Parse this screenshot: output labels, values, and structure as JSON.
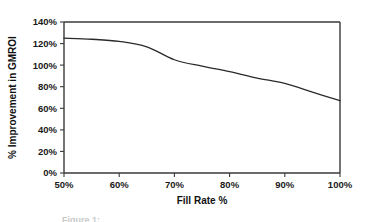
{
  "chart_data": {
    "type": "line",
    "title": "",
    "xlabel": "Fill Rate %",
    "ylabel": "% Improvement in GMROI",
    "xlim": [
      50,
      100
    ],
    "ylim": [
      0,
      140
    ],
    "grid": false,
    "legend": "none",
    "x_tick_labels": [
      "50%",
      "60%",
      "70%",
      "80%",
      "90%",
      "100%"
    ],
    "x_tick_values": [
      50,
      60,
      70,
      80,
      90,
      100
    ],
    "y_tick_labels": [
      "0%",
      "20%",
      "40%",
      "60%",
      "80%",
      "100%",
      "120%",
      "140%"
    ],
    "y_tick_values": [
      0,
      20,
      40,
      60,
      80,
      100,
      120,
      140
    ],
    "series": [
      {
        "name": "% Improvement in GMROI",
        "color": "#2a2a2a",
        "x": [
          50,
          55,
          60,
          65,
          70,
          75,
          80,
          85,
          90,
          95,
          100
        ],
        "values": [
          125,
          124,
          122,
          117,
          105,
          99,
          94,
          88,
          83,
          75,
          67
        ]
      }
    ]
  },
  "figure": {
    "caption_partial": "Figure 1:"
  }
}
